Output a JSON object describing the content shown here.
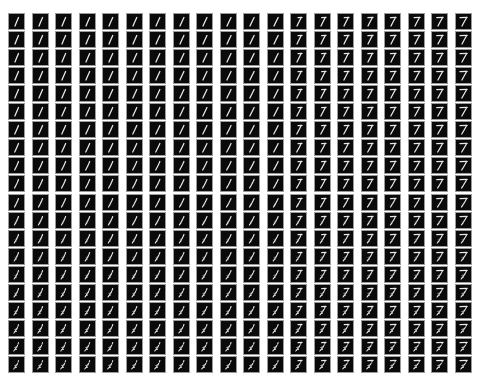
{
  "figure": {
    "rows": 20,
    "cols": 20,
    "origin_x": 9,
    "origin_y": 14,
    "pitch_x": 23.5,
    "pitch_y": 18.05,
    "cell_size": 15,
    "colors": {
      "background": "#ffffff",
      "tile": "#0a0a0a",
      "tile_border": "#9a9a9a",
      "stroke": "#e8e8e8"
    },
    "column_morph": {
      "start_label": "1",
      "end_label": "7",
      "values": [
        0,
        0.05,
        0.1,
        0.15,
        0.2,
        0.25,
        0.3,
        0.35,
        0.4,
        0.45,
        0.5,
        0.55,
        0.6,
        0.65,
        0.7,
        0.75,
        0.8,
        0.85,
        0.9,
        1.0
      ]
    },
    "row_morph": {
      "start_label": "clean stroke",
      "end_label": "fragmented scribble",
      "values": [
        0,
        0,
        0.02,
        0.05,
        0.08,
        0.1,
        0.14,
        0.18,
        0.22,
        0.28,
        0.34,
        0.4,
        0.46,
        0.52,
        0.58,
        0.64,
        0.7,
        0.76,
        0.82,
        0.88
      ]
    }
  }
}
